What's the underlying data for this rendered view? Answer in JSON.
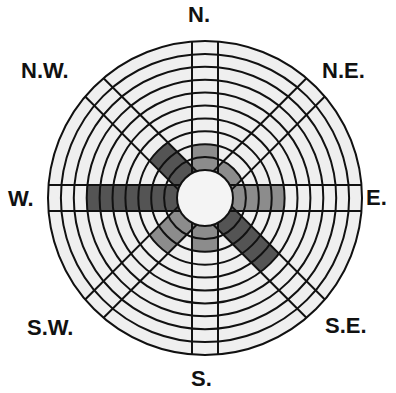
{
  "chart_data": {
    "type": "wind-rose",
    "title": "",
    "rings": 10,
    "directions": [
      "N.",
      "N.E.",
      "E.",
      "S.E.",
      "S.",
      "S.W.",
      "W.",
      "N.W."
    ],
    "values": [
      2,
      1,
      4,
      5,
      2,
      3,
      7,
      3
    ],
    "shade": [
      "medium",
      "medium",
      "medium",
      "dark",
      "medium",
      "medium",
      "dark",
      "dark"
    ],
    "colors": {
      "background": "#ffffff",
      "empty_cell": "#efefef",
      "medium": "#8c8c8c",
      "dark": "#545454",
      "hub": "#f4f4f4",
      "line": "#111111"
    },
    "center": [
      205,
      198
    ],
    "outer_radius": 157,
    "hub_radius": 28,
    "spoke_half_width": 13
  },
  "labels": {
    "n": "N.",
    "ne": "N.E.",
    "e": "E.",
    "se": "S.E.",
    "s": "S.",
    "sw": "S.W.",
    "w": "W.",
    "nw": "N.W."
  }
}
